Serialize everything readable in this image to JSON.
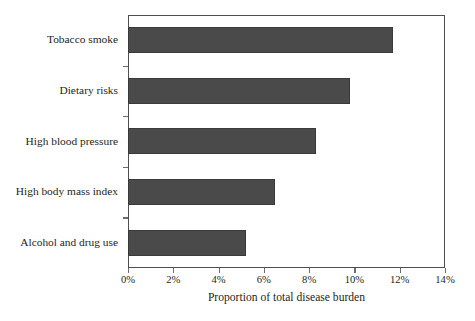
{
  "chart_data": {
    "type": "bar",
    "orientation": "horizontal",
    "title": "",
    "subtitle": "",
    "xlabel": "Proportion of total disease burden",
    "ylabel": "",
    "categories": [
      "Tobacco smoke",
      "Dietary risks",
      "High blood pressure",
      "High body mass index",
      "Alcohol and drug use"
    ],
    "values": [
      11.7,
      9.8,
      8.3,
      6.5,
      5.2
    ],
    "value_unit": "%",
    "xlim": [
      0,
      14
    ],
    "ylim": null,
    "xticks": [
      0,
      2,
      4,
      6,
      8,
      10,
      12,
      14
    ],
    "xticklabels": [
      "0%",
      "2%",
      "4%",
      "6%",
      "8%",
      "10%",
      "12%",
      "14%"
    ],
    "grid": false,
    "legend": null,
    "legend_position": "none",
    "bar_color": "#4a4a4a",
    "frame_color": "#4f4f4f",
    "background_color": "#ffffff",
    "text_color": "#231f20",
    "annotations": []
  }
}
